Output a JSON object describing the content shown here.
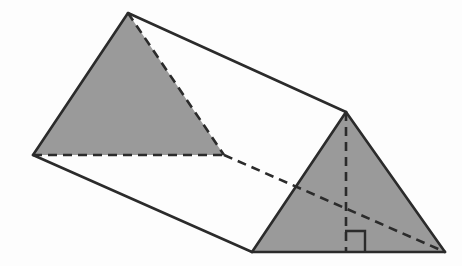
{
  "figure": {
    "title": "Triangular prism",
    "description": "An oblique view of a triangular prism with two shaded triangular end faces, hidden edges shown dashed, and a dashed altitude with a right-angle marker on the front triangular face.",
    "canvas": {
      "width": 462,
      "height": 266
    },
    "colors": {
      "background": "#fdfdfd",
      "shaded_face": "#9a9a9a",
      "open_face": "#fdfdfd",
      "stroke": "#2b2b2b"
    },
    "stroke_width": 2.6,
    "dash_pattern": "9 6"
  },
  "geometry": {
    "vertices": {
      "back_apex": {
        "label": "back-apex",
        "x": 128,
        "y": 13
      },
      "back_left": {
        "label": "back-left",
        "x": 33,
        "y": 155
      },
      "back_right": {
        "label": "back-right",
        "x": 224,
        "y": 155
      },
      "front_apex": {
        "label": "front-apex",
        "x": 346,
        "y": 112
      },
      "front_left": {
        "label": "front-left",
        "x": 252,
        "y": 252
      },
      "front_right": {
        "label": "front-right",
        "x": 445,
        "y": 252
      },
      "altitude_foot": {
        "label": "altitude-foot",
        "x": 346,
        "y": 252
      }
    },
    "faces": {
      "back_triangle": {
        "name": "back-triangular-face",
        "shaded": true,
        "points": "128,13 33,155 224,155"
      },
      "front_triangle": {
        "name": "front-triangular-face",
        "shaded": true,
        "points": "346,112 252,252 445,252"
      },
      "top_rectangle": {
        "name": "top-rectangular-face",
        "shaded": false,
        "points": "128,13 346,112 252,252 33,155"
      }
    },
    "solid_edges": [
      {
        "name": "edge-back-apex-to-back-left",
        "d": "M 128 13 L 33 155"
      },
      {
        "name": "edge-back-apex-to-front-apex",
        "d": "M 128 13 L 346 112"
      },
      {
        "name": "edge-back-left-to-front-left",
        "d": "M 33 155 L 252 252"
      },
      {
        "name": "edge-front-apex-to-front-left",
        "d": "M 346 112 L 252 252"
      },
      {
        "name": "edge-front-apex-to-front-right",
        "d": "M 346 112 L 445 252"
      },
      {
        "name": "edge-front-left-to-front-right",
        "d": "M 252 252 L 445 252"
      }
    ],
    "dashed_edges": [
      {
        "name": "hidden-edge-back-apex-to-back-right",
        "d": "M 128 13 L 224 155"
      },
      {
        "name": "hidden-edge-back-left-to-back-right",
        "d": "M 33 155 L 224 155"
      },
      {
        "name": "hidden-edge-back-right-to-front-right",
        "d": "M 224 155 L 445 252"
      },
      {
        "name": "altitude-line",
        "d": "M 346 112 L 346 252"
      }
    ],
    "right_angle_marker": {
      "name": "right-angle-marker",
      "d": "M 345 231 L 365 231 L 365 252",
      "size": 21,
      "corner_x": 346,
      "corner_y": 252
    }
  }
}
